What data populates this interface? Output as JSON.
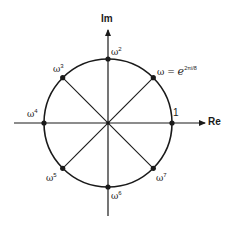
{
  "diagram": {
    "axes": {
      "real_label": "Re",
      "imag_label": "Im",
      "unit_label": "1"
    },
    "roots": [
      {
        "base": "ω",
        "exp": "",
        "angle_deg": 45
      },
      {
        "base": "ω",
        "exp": "2",
        "angle_deg": 90
      },
      {
        "base": "ω",
        "exp": "3",
        "angle_deg": 135
      },
      {
        "base": "ω",
        "exp": "4",
        "angle_deg": 180
      },
      {
        "base": "ω",
        "exp": "5",
        "angle_deg": 225
      },
      {
        "base": "ω",
        "exp": "6",
        "angle_deg": 270
      },
      {
        "base": "ω",
        "exp": "7",
        "angle_deg": 315
      }
    ],
    "omega_definition": {
      "lhs": "ω = ",
      "base": "e",
      "exponent": "2πi/8"
    },
    "colors": {
      "stroke": "#1a1a1a",
      "background": "#ffffff"
    }
  }
}
